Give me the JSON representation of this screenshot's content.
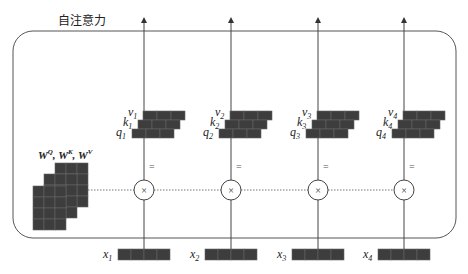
{
  "title": "自注意力",
  "weights_label": {
    "W": "W",
    "q": "Q",
    "k": "K",
    "v": "V"
  },
  "columns": [
    {
      "x": 144,
      "v": "v",
      "k": "k",
      "q": "q",
      "x_label": "x",
      "sub": "1"
    },
    {
      "x": 231,
      "v": "v",
      "k": "k",
      "q": "q",
      "x_label": "x",
      "sub": "2"
    },
    {
      "x": 318,
      "v": "v",
      "k": "k",
      "q": "q",
      "x_label": "x",
      "sub": "3"
    },
    {
      "x": 404,
      "v": "v",
      "k": "k",
      "q": "q",
      "x_label": "x",
      "sub": "4"
    }
  ],
  "operators": {
    "equals": "=",
    "multiply": "×"
  },
  "colors": {
    "cell": "#3d3d3d",
    "cell_border": "#666666",
    "line": "#444444",
    "box": "#555555"
  }
}
